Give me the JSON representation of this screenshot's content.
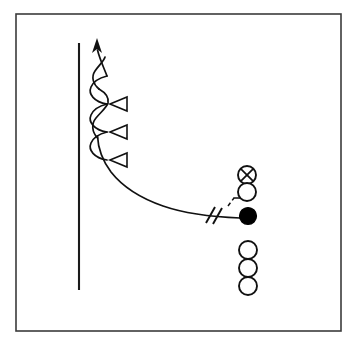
{
  "diagram": {
    "kind": "x-and-o play schematic",
    "canvas": {
      "width": 354,
      "height": 346,
      "background": "#ffffff"
    },
    "frame": {
      "name": "diagram-border",
      "x": 16,
      "y": 14,
      "width": 325,
      "height": 317,
      "stroke": "#3b3b3b",
      "stroke_width": 1.6
    },
    "sideline": {
      "name": "sideline",
      "label": "sideline",
      "x": 79,
      "y1": 43,
      "y2": 290,
      "stroke": "#1a1a1a",
      "stroke_width": 2.1
    },
    "route": {
      "name": "receiver-route",
      "label": "receiver release route",
      "stroke": "#111111",
      "stroke_width": 1.7,
      "path": "M 240 218 C 200 216 150 210 119 188 C 100 174 95 152 96 132 C 97 112 97 80 97 52",
      "scallops": [
        {
          "cx": 96,
          "cy": 96,
          "r": 12
        },
        {
          "cx": 96,
          "cy": 124,
          "r": 12
        },
        {
          "cx": 96,
          "cy": 152,
          "r": 12
        }
      ],
      "arrow": {
        "name": "route-arrowhead",
        "points": "97,38 92,53 97,49 102,53",
        "direction": "up",
        "fill": "#111111"
      }
    },
    "chevrons": [
      {
        "name": "chevron-marker-1",
        "points": "108,90 126,83 126,97",
        "cy": 90
      },
      {
        "name": "chevron-marker-2",
        "points": "108,118 126,111 126,125",
        "cy": 118
      },
      {
        "name": "chevron-marker-3",
        "points": "108,146 126,139 126,153",
        "cy": 146
      }
    ],
    "hash_marks": {
      "name": "route-hash-marks",
      "label": "double hash tick",
      "ticks": [
        {
          "x1": 206,
          "y1": 223,
          "x2": 215,
          "y2": 207
        },
        {
          "x1": 213,
          "y1": 224,
          "x2": 222,
          "y2": 208
        }
      ]
    },
    "motion_hook": {
      "name": "motion-hook",
      "label": "motion/shift hook from ball carrier to receiver",
      "solid_path": "M 234 198 L 247 198 C 250 198 250 193 248 190",
      "dashed_path": "M 228 206 L 234 198"
    },
    "players": [
      {
        "name": "player-x-defender",
        "type": "x-circle",
        "label": "X over O",
        "cx": 247,
        "cy": 175,
        "r": 9,
        "fill": "#ffffff",
        "stroke": "#111111"
      },
      {
        "name": "player-open-1",
        "type": "open-circle",
        "label": "O",
        "cx": 247,
        "cy": 192,
        "r": 9,
        "fill": "#ffffff",
        "stroke": "#111111"
      },
      {
        "name": "player-ball-carrier",
        "type": "filled-circle",
        "label": "ball carrier",
        "cx": 248,
        "cy": 216,
        "r": 8.5,
        "fill": "#000000",
        "stroke": "#000000"
      },
      {
        "name": "player-open-2",
        "type": "open-circle",
        "label": "O",
        "cx": 248,
        "cy": 250,
        "r": 9,
        "fill": "#ffffff",
        "stroke": "#111111"
      },
      {
        "name": "player-open-3",
        "type": "open-circle",
        "label": "O",
        "cx": 248,
        "cy": 268,
        "r": 9,
        "fill": "#ffffff",
        "stroke": "#111111"
      },
      {
        "name": "player-open-4",
        "type": "open-circle",
        "label": "O",
        "cx": 248,
        "cy": 286,
        "r": 9,
        "fill": "#ffffff",
        "stroke": "#111111"
      }
    ]
  }
}
